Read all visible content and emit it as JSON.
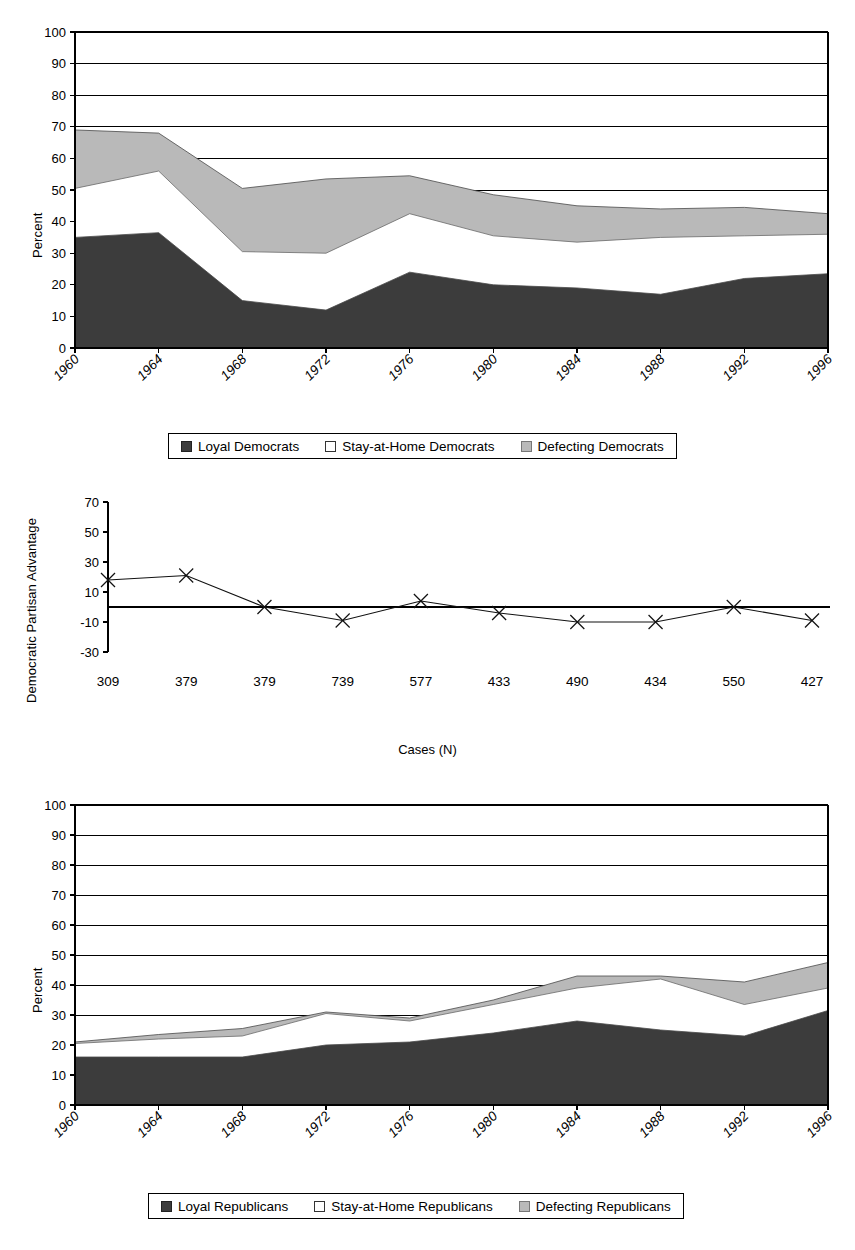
{
  "figure": {
    "width": 855,
    "height": 1250,
    "background": "#ffffff"
  },
  "colors": {
    "loyal": "#3c3c3c",
    "stay_at_home": "#ffffff",
    "defecting": "#b9b9b9",
    "axis": "#000000",
    "gridline": "#000000"
  },
  "panels": [
    {
      "id": "democrats",
      "ylabel": "Percent",
      "legend": [
        {
          "label": "Loyal Democrats",
          "swatch": "loyal"
        },
        {
          "label": "Stay-at-Home Democrats",
          "swatch": "stay_at_home"
        },
        {
          "label": "Defecting Democrats",
          "swatch": "defecting"
        }
      ]
    },
    {
      "id": "partisan-advantage",
      "ylabel": "Democratic Partisan Advantage",
      "xlabel": "Cases (N)"
    },
    {
      "id": "republicans",
      "ylabel": "Percent",
      "legend": [
        {
          "label": "Loyal Republicans",
          "swatch": "loyal"
        },
        {
          "label": "Stay-at-Home Republicans",
          "swatch": "stay_at_home"
        },
        {
          "label": "Defecting Republicans",
          "swatch": "defecting"
        }
      ]
    }
  ],
  "chart_data": [
    {
      "type": "area",
      "id": "democrats",
      "title": "",
      "xlabel": "",
      "ylabel": "Percent",
      "stacked": true,
      "grid": true,
      "legend_position": "bottom",
      "categories": [
        "1960",
        "1964",
        "1968",
        "1972",
        "1976",
        "1980",
        "1984",
        "1988",
        "1992",
        "1996"
      ],
      "xtick_labels": [
        "1960",
        "1964",
        "1968",
        "1972",
        "1976",
        "1980",
        "1984",
        "1988",
        "1992",
        "1996"
      ],
      "ytick_labels": [
        "0",
        "10",
        "20",
        "30",
        "40",
        "50",
        "60",
        "70",
        "80",
        "90",
        "100"
      ],
      "ylim": [
        0,
        100
      ],
      "series": [
        {
          "name": "Loyal Democrats",
          "values": [
            35,
            36.5,
            15,
            12,
            24,
            20,
            19,
            17,
            22,
            23.5
          ]
        },
        {
          "name": "Stay-at-Home Democrats",
          "values": [
            15.5,
            19.5,
            15.5,
            18,
            18.5,
            15.5,
            14.5,
            18,
            13.5,
            12.5
          ]
        },
        {
          "name": "Defecting Democrats",
          "values": [
            18.5,
            12,
            20,
            23.5,
            12,
            13,
            11.5,
            9,
            9,
            6.5
          ]
        }
      ],
      "cumulative_tops": {
        "Loyal Democrats": [
          35,
          36.5,
          15,
          12,
          24,
          20,
          19,
          17,
          22,
          23.5
        ],
        "Stay-at-Home Democrats": [
          50.5,
          56,
          30.5,
          30,
          42.5,
          35.5,
          33.5,
          35,
          35.5,
          36
        ],
        "Defecting Democrats": [
          69,
          68,
          50.5,
          53.5,
          54.5,
          48.5,
          45,
          44,
          44.5,
          42.5
        ]
      }
    },
    {
      "type": "line",
      "id": "partisan-advantage",
      "title": "",
      "xlabel": "Cases (N)",
      "ylabel": "Democratic Partisan Advantage",
      "grid": false,
      "marker": "x",
      "zero_line": true,
      "ylim": [
        -30,
        70
      ],
      "ytick_labels": [
        "-30",
        "-10",
        "10",
        "30",
        "50",
        "70"
      ],
      "categories": [
        "309",
        "379",
        "379",
        "739",
        "577",
        "433",
        "490",
        "434",
        "550",
        "427"
      ],
      "xtick_labels": [
        "309",
        "379",
        "379",
        "739",
        "577",
        "433",
        "490",
        "434",
        "550",
        "427"
      ],
      "values": [
        18,
        21,
        0,
        -9,
        4,
        -4,
        -10,
        -10,
        0,
        -9
      ]
    },
    {
      "type": "area",
      "id": "republicans",
      "title": "",
      "xlabel": "",
      "ylabel": "Percent",
      "stacked": true,
      "grid": true,
      "legend_position": "bottom",
      "categories": [
        "1960",
        "1964",
        "1968",
        "1972",
        "1976",
        "1980",
        "1984",
        "1988",
        "1992",
        "1996"
      ],
      "xtick_labels": [
        "1960",
        "1964",
        "1968",
        "1972",
        "1976",
        "1980",
        "1984",
        "1988",
        "1992",
        "1996"
      ],
      "ytick_labels": [
        "0",
        "10",
        "20",
        "30",
        "40",
        "50",
        "60",
        "70",
        "80",
        "90",
        "100"
      ],
      "ylim": [
        0,
        100
      ],
      "series": [
        {
          "name": "Loyal Republicans",
          "values": [
            16,
            16,
            16,
            20,
            21,
            24,
            28,
            25,
            23,
            31.5
          ]
        },
        {
          "name": "Stay-at-Home Republicans",
          "values": [
            4.5,
            6,
            7,
            10.5,
            7,
            9.5,
            11,
            17,
            10.5,
            7.5
          ]
        },
        {
          "name": "Defecting Republicans",
          "values": [
            0.5,
            1.5,
            2.5,
            0.5,
            1,
            1.5,
            4,
            1,
            7.5,
            8.5
          ]
        }
      ],
      "cumulative_tops": {
        "Loyal Republicans": [
          16,
          16,
          16,
          20,
          21,
          24,
          28,
          25,
          23,
          31.5
        ],
        "Stay-at-Home Republicans": [
          20.5,
          22,
          23,
          30.5,
          28,
          33.5,
          39,
          42,
          33.5,
          39
        ],
        "Defecting Republicans": [
          21,
          23.5,
          25.5,
          31,
          29,
          35,
          43,
          43,
          41,
          47.5
        ]
      }
    }
  ]
}
